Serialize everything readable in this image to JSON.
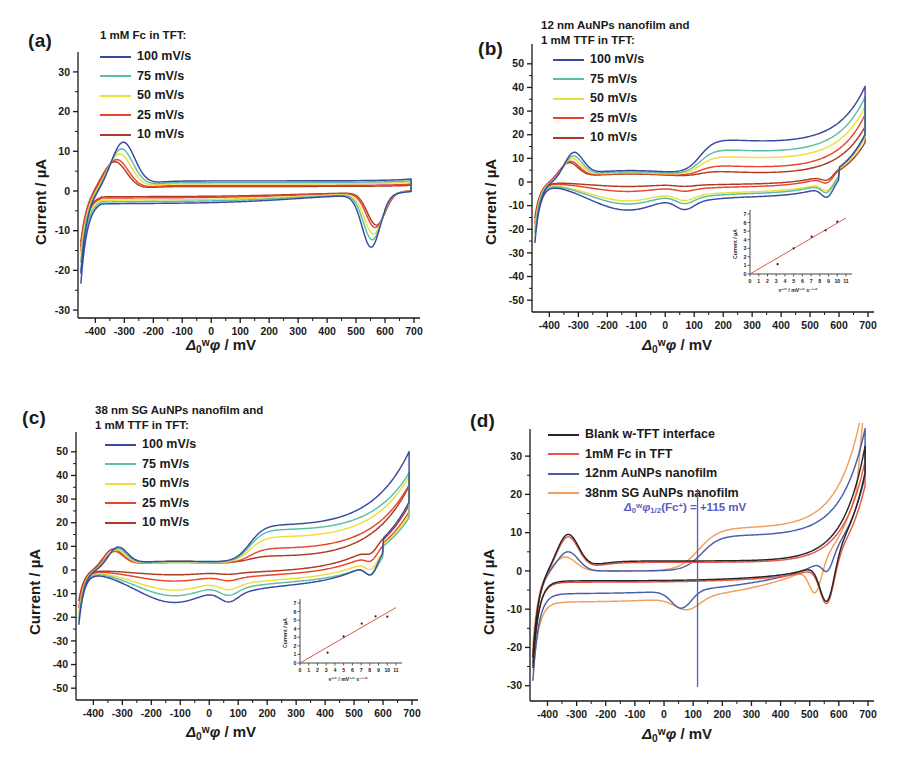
{
  "figure": {
    "panels": [
      {
        "id": "a",
        "label": "(a)",
        "legend_title": "1 mM Fc in TFT:",
        "legend_title_lines": [
          "1 mM Fc in TFT:"
        ],
        "ylabel": "Current / µA",
        "xlabel_prefix": "Δ",
        "xlabel_sup": "w",
        "xlabel_sub": "0",
        "xlabel_suffix": "φ / mV",
        "series": [
          {
            "label": "100 mV/s",
            "color": "#3b4a9e"
          },
          {
            "label": "75 mV/s",
            "color": "#5bbfa8"
          },
          {
            "label": "50 mV/s",
            "color": "#ecdf3c"
          },
          {
            "label": "25 mV/s",
            "color": "#e8452c"
          },
          {
            "label": "10 mV/s",
            "color": "#b03a22"
          }
        ],
        "xlim": [
          -460,
          700
        ],
        "ylim": [
          -32,
          33
        ],
        "xticks": [
          -400,
          -300,
          -200,
          -100,
          0,
          100,
          200,
          300,
          400,
          500,
          600,
          700
        ],
        "yticks": [
          -30,
          -20,
          -10,
          0,
          10,
          20,
          30
        ],
        "inset": null
      },
      {
        "id": "b",
        "label": "(b)",
        "legend_title": "12 nm AuNPs nanofilm and 1 mM TTF in TFT:",
        "legend_title_lines": [
          "12 nm AuNPs nanofilm and",
          "1 mM TTF in TFT:"
        ],
        "ylabel": "Current / µA",
        "xlabel_prefix": "Δ",
        "xlabel_sup": "w",
        "xlabel_sub": "0",
        "xlabel_suffix": "φ / mV",
        "series": [
          {
            "label": "100 mV/s",
            "color": "#3b4a9e"
          },
          {
            "label": "75 mV/s",
            "color": "#5bbfa8"
          },
          {
            "label": "50 mV/s",
            "color": "#ecdf3c"
          },
          {
            "label": "25 mV/s",
            "color": "#e8452c"
          },
          {
            "label": "10 mV/s",
            "color": "#b03a22"
          }
        ],
        "xlim": [
          -460,
          700
        ],
        "ylim": [
          -55,
          55
        ],
        "xticks": [
          -400,
          -300,
          -200,
          -100,
          0,
          100,
          200,
          300,
          400,
          500,
          600,
          700
        ],
        "yticks": [
          -50,
          -40,
          -30,
          -20,
          -10,
          0,
          10,
          20,
          30,
          40,
          50
        ],
        "inset": {
          "xlabel_main": "ν",
          "xlabel_sup": "1/2",
          "xlabel_rest": " / mV",
          "xlabel_sup2": "1/2",
          "xlabel_rest2": " s",
          "xlabel_sup3": "-1/2",
          "ylabel": "Current / µA",
          "xticks": [
            0,
            1,
            2,
            3,
            4,
            5,
            6,
            7,
            8,
            9,
            10,
            11
          ],
          "yticks": [
            0,
            1,
            2,
            3,
            4,
            5,
            6,
            7
          ],
          "fit_color": "#d4453a",
          "point_color": "#222222",
          "points": [
            {
              "x": 3.16,
              "y": 1.15
            },
            {
              "x": 5.0,
              "y": 3.0
            },
            {
              "x": 7.07,
              "y": 4.35
            },
            {
              "x": 8.66,
              "y": 5.1
            },
            {
              "x": 10.0,
              "y": 6.1
            }
          ]
        }
      },
      {
        "id": "c",
        "label": "(c)",
        "legend_title": "38 nm SG AuNPs nanofilm and 1 mM TTF in TFT:",
        "legend_title_lines": [
          "38 nm SG AuNPs nanofilm and",
          "1 mM TTF in TFT:"
        ],
        "ylabel": "Current / µA",
        "xlabel_prefix": "Δ",
        "xlabel_sup": "w",
        "xlabel_sub": "0",
        "xlabel_suffix": "φ / mV",
        "series": [
          {
            "label": "100 mV/s",
            "color": "#3b4a9e"
          },
          {
            "label": "75 mV/s",
            "color": "#5bbfa8"
          },
          {
            "label": "50 mV/s",
            "color": "#ecdf3c"
          },
          {
            "label": "25 mV/s",
            "color": "#e8452c"
          },
          {
            "label": "10 mV/s",
            "color": "#b03a22"
          }
        ],
        "xlim": [
          -460,
          700
        ],
        "ylim": [
          -55,
          55
        ],
        "xticks": [
          -400,
          -300,
          -200,
          -100,
          0,
          100,
          200,
          300,
          400,
          500,
          600,
          700
        ],
        "yticks": [
          -50,
          -40,
          -30,
          -20,
          -10,
          0,
          10,
          20,
          30,
          40,
          50
        ],
        "inset": {
          "xlabel_main": "ν",
          "xlabel_sup": "1/2",
          "xlabel_rest": " / mV",
          "xlabel_sup2": "1/2",
          "xlabel_rest2": " s",
          "xlabel_sup3": "-1/2",
          "ylabel": "Current / µA",
          "xticks": [
            0,
            1,
            2,
            3,
            4,
            5,
            6,
            7,
            8,
            9,
            10,
            11
          ],
          "yticks": [
            0,
            1,
            2,
            3,
            4,
            5,
            6,
            7
          ],
          "fit_color": "#d4453a",
          "point_color": "#222222",
          "points": [
            {
              "x": 3.16,
              "y": 1.2
            },
            {
              "x": 5.0,
              "y": 3.1
            },
            {
              "x": 7.07,
              "y": 4.6
            },
            {
              "x": 8.66,
              "y": 5.45
            },
            {
              "x": 10.0,
              "y": 5.4
            }
          ]
        }
      },
      {
        "id": "d",
        "label": "(d)",
        "legend_title": "",
        "legend_title_lines": [],
        "ylabel": "Current / µA",
        "xlabel_prefix": "Δ",
        "xlabel_sup": "w",
        "xlabel_sub": "0",
        "xlabel_suffix": "φ / mV",
        "series": [
          {
            "label": "Blank w-TFT interface",
            "color": "#262626"
          },
          {
            "label": "1mM Fc in TFT",
            "color": "#e8564a"
          },
          {
            "label": "12nm AuNPs nanofilm",
            "color": "#4a5fa8"
          },
          {
            "label": "38nm SG AuNPs nanofilm",
            "color": "#f0a05a"
          }
        ],
        "xlim": [
          -460,
          700
        ],
        "ylim": [
          -34,
          35
        ],
        "xticks": [
          -400,
          -300,
          -200,
          -100,
          0,
          100,
          200,
          300,
          400,
          500,
          600,
          700
        ],
        "yticks": [
          -30,
          -20,
          -10,
          0,
          10,
          20,
          30
        ],
        "annotation": {
          "prefix": "Δ",
          "sup": "w",
          "sub": "0",
          "phi": "φ",
          "phi_sub": "1/2",
          "species": "(Fc",
          "species_sup": "+",
          "species_close": ")",
          "equals": " = +115 mV",
          "color": "#5b5bc0",
          "marker_x": 115
        },
        "inset": null
      }
    ]
  },
  "chart_data": [
    {
      "type": "line",
      "panel": "a",
      "title": "1 mM Fc in TFT",
      "xlabel": "Δ(w,0)φ / mV",
      "ylabel": "Current / µA",
      "xlim": [
        -460,
        700
      ],
      "ylim": [
        -32,
        33
      ],
      "grid": false,
      "legend_position": "top-left",
      "series": [
        {
          "name": "100 mV/s",
          "color": "#3b4a9e",
          "peak_forward_uA": 11.8,
          "peak_forward_mV": -305,
          "peak_reverse_uA": -13.2,
          "peak_reverse_mV": 552,
          "end_positive_uA": 32.5,
          "end_negative_uA": -29.0
        },
        {
          "name": "75 mV/s",
          "color": "#5bbfa8",
          "peak_forward_uA": 10.2,
          "peak_forward_mV": -310,
          "peak_reverse_uA": -11.3,
          "peak_reverse_mV": 556,
          "end_positive_uA": 29.5,
          "end_negative_uA": -25.0
        },
        {
          "name": "50 mV/s",
          "color": "#ecdf3c",
          "peak_forward_uA": 9.0,
          "peak_forward_mV": -318,
          "peak_reverse_uA": -9.6,
          "peak_reverse_mV": 560,
          "end_positive_uA": 27.5,
          "end_negative_uA": -23.0
        },
        {
          "name": "25 mV/s",
          "color": "#e8452c",
          "peak_forward_uA": 7.8,
          "peak_forward_mV": -330,
          "peak_reverse_uA": -7.6,
          "peak_reverse_mV": 566,
          "end_positive_uA": 23.0,
          "end_negative_uA": -21.0
        },
        {
          "name": "10 mV/s",
          "color": "#b03a22",
          "peak_forward_uA": 7.4,
          "peak_forward_mV": -338,
          "peak_reverse_uA": -7.0,
          "peak_reverse_mV": 570,
          "end_positive_uA": 26.0,
          "end_negative_uA": -18.0
        }
      ]
    },
    {
      "type": "line",
      "panel": "b",
      "title": "12 nm AuNPs nanofilm and 1 mM TTF in TFT",
      "xlabel": "Δ(w,0)φ / mV",
      "ylabel": "Current / µA",
      "xlim": [
        -460,
        700
      ],
      "ylim": [
        -55,
        55
      ],
      "grid": false,
      "legend_position": "top-left",
      "series": [
        {
          "name": "100 mV/s",
          "color": "#3b4a9e",
          "plateau_forward_uA": 16.3,
          "peak_forward_uA": 10.4,
          "plateau_reverse_uA": -12.5,
          "end_positive_uA": 40.5,
          "end_negative_uA": -33.5
        },
        {
          "name": "75 mV/s",
          "color": "#5bbfa8",
          "plateau_forward_uA": 12.2,
          "peak_forward_uA": 9.2,
          "plateau_reverse_uA": -9.8,
          "end_positive_uA": 36.0,
          "end_negative_uA": -28.0
        },
        {
          "name": "50 mV/s",
          "color": "#ecdf3c",
          "plateau_forward_uA": 9.4,
          "peak_forward_uA": 8.4,
          "plateau_reverse_uA": -8.4,
          "end_positive_uA": 32.0,
          "end_negative_uA": -25.0
        },
        {
          "name": "25 mV/s",
          "color": "#e8452c",
          "plateau_forward_uA": 5.6,
          "peak_forward_uA": 7.6,
          "plateau_reverse_uA": -4.2,
          "end_positive_uA": 28.5,
          "end_negative_uA": -23.0
        },
        {
          "name": "10 mV/s",
          "color": "#b03a22",
          "plateau_forward_uA": 3.2,
          "peak_forward_uA": 7.2,
          "plateau_reverse_uA": -2.0,
          "end_positive_uA": 23.5,
          "end_negative_uA": -20.0
        }
      ],
      "inset": {
        "type": "scatter",
        "xlabel": "ν^(1/2) / mV^(1/2) s^(-1/2)",
        "ylabel": "Current / µA",
        "xlim": [
          0,
          11
        ],
        "ylim": [
          0,
          7
        ],
        "x": [
          3.16,
          5.0,
          7.07,
          8.66,
          10.0
        ],
        "y": [
          1.15,
          3.0,
          4.35,
          5.1,
          6.1
        ],
        "fit": "linear through origin"
      }
    },
    {
      "type": "line",
      "panel": "c",
      "title": "38 nm SG AuNPs nanofilm and 1 mM TTF in TFT",
      "xlabel": "Δ(w,0)φ / mV",
      "ylabel": "Current / µA",
      "xlim": [
        -460,
        700
      ],
      "ylim": [
        -55,
        55
      ],
      "grid": false,
      "legend_position": "top-left",
      "series": [
        {
          "name": "100 mV/s",
          "color": "#3b4a9e",
          "plateau_forward_uA": 16.5,
          "peak_forward_uA": 7.8,
          "plateau_reverse_uA": -14.5,
          "end_positive_uA": 50.0,
          "end_negative_uA": -30.0
        },
        {
          "name": "75 mV/s",
          "color": "#5bbfa8",
          "plateau_forward_uA": 14.8,
          "peak_forward_uA": 7.4,
          "plateau_reverse_uA": -11.5,
          "end_positive_uA": 41.0,
          "end_negative_uA": -27.0
        },
        {
          "name": "50 mV/s",
          "color": "#ecdf3c",
          "plateau_forward_uA": 11.8,
          "peak_forward_uA": 7.0,
          "plateau_reverse_uA": -9.0,
          "end_positive_uA": 39.5,
          "end_negative_uA": -24.0
        },
        {
          "name": "25 mV/s",
          "color": "#e8452c",
          "plateau_forward_uA": 7.0,
          "peak_forward_uA": 6.6,
          "plateau_reverse_uA": -5.0,
          "end_positive_uA": 36.0,
          "end_negative_uA": -21.0
        },
        {
          "name": "10 mV/s",
          "color": "#b03a22",
          "plateau_forward_uA": 3.4,
          "peak_forward_uA": 7.6,
          "plateau_reverse_uA": -2.2,
          "end_positive_uA": 35.5,
          "end_negative_uA": -17.0
        }
      ],
      "inset": {
        "type": "scatter",
        "xlabel": "ν^(1/2) / mV^(1/2) s^(-1/2)",
        "ylabel": "Current / µA",
        "xlim": [
          0,
          11
        ],
        "ylim": [
          0,
          7
        ],
        "x": [
          3.16,
          5.0,
          7.07,
          8.66,
          10.0
        ],
        "y": [
          1.2,
          3.1,
          4.6,
          5.45,
          5.4
        ],
        "fit": "linear through origin"
      }
    },
    {
      "type": "line",
      "panel": "d",
      "title": "Comparison of interfaces",
      "xlabel": "Δ(w,0)φ / mV",
      "ylabel": "Current / µA",
      "xlim": [
        -460,
        700
      ],
      "ylim": [
        -34,
        35
      ],
      "grid": false,
      "legend_position": "top-left",
      "annotation_text": "Δ(w,0)φ(1/2)(Fc+) = +115 mV",
      "annotation_value_mV": 115,
      "series": [
        {
          "name": "Blank w-TFT interface",
          "color": "#262626",
          "peak_forward_uA": 9.3,
          "peak_reverse_uA": -11.3,
          "end_positive_uA": 33.0,
          "end_negative_uA": -29.0
        },
        {
          "name": "1mM Fc in TFT",
          "color": "#e8564a",
          "peak_forward_uA": 9.0,
          "peak_reverse_uA": -11.0,
          "end_positive_uA": 29.5,
          "end_negative_uA": -27.0
        },
        {
          "name": "12nm AuNPs nanofilm",
          "color": "#4a5fa8",
          "plateau_forward_uA": 9.2,
          "peak_reverse_uA": -10.5,
          "end_positive_uA": 33.0,
          "end_negative_uA": -29.0
        },
        {
          "name": "38nm SG AuNPs nanofilm",
          "color": "#f0a05a",
          "plateau_forward_uA": 11.2,
          "peak_reverse_uA": -12.0,
          "end_positive_uA": 34.5,
          "end_negative_uA": -25.0
        }
      ]
    }
  ]
}
